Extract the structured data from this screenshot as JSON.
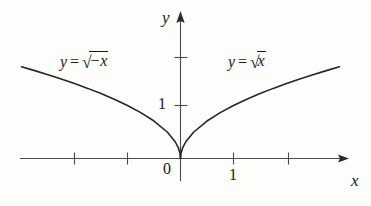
{
  "chart_data": {
    "type": "line",
    "title": "",
    "xlabel": "x",
    "ylabel": "y",
    "xlim": [
      -3.0,
      3.1
    ],
    "ylim": [
      -0.45,
      2.9
    ],
    "grid": false,
    "legend": "inline-annotations",
    "x_ticks": [
      -2,
      -1,
      1,
      2
    ],
    "x_tick_labels": [
      "",
      "",
      "1",
      ""
    ],
    "y_ticks": [
      1,
      2
    ],
    "y_tick_labels": [
      "1",
      ""
    ],
    "origin_label": "0",
    "axis_arrows": [
      "x-positive",
      "y-positive"
    ],
    "series": [
      {
        "name": "y = sqrt(-x)",
        "equation": "y = √(−x)",
        "domain": [
          -3.0,
          0
        ],
        "points": [
          {
            "x": -3.0,
            "y": 1.732
          },
          {
            "x": -2.75,
            "y": 1.658
          },
          {
            "x": -2.5,
            "y": 1.581
          },
          {
            "x": -2.25,
            "y": 1.5
          },
          {
            "x": -2.0,
            "y": 1.414
          },
          {
            "x": -1.75,
            "y": 1.323
          },
          {
            "x": -1.5,
            "y": 1.225
          },
          {
            "x": -1.25,
            "y": 1.118
          },
          {
            "x": -1.0,
            "y": 1.0
          },
          {
            "x": -0.75,
            "y": 0.866
          },
          {
            "x": -0.5,
            "y": 0.707
          },
          {
            "x": -0.25,
            "y": 0.5
          },
          {
            "x": -0.1,
            "y": 0.316
          },
          {
            "x": -0.04,
            "y": 0.2
          },
          {
            "x": -0.01,
            "y": 0.1
          },
          {
            "x": 0,
            "y": 0
          }
        ]
      },
      {
        "name": "y = sqrt(x)",
        "equation": "y = √x",
        "domain": [
          0,
          3.0
        ],
        "points": [
          {
            "x": 0,
            "y": 0
          },
          {
            "x": 0.01,
            "y": 0.1
          },
          {
            "x": 0.04,
            "y": 0.2
          },
          {
            "x": 0.1,
            "y": 0.316
          },
          {
            "x": 0.25,
            "y": 0.5
          },
          {
            "x": 0.5,
            "y": 0.707
          },
          {
            "x": 0.75,
            "y": 0.866
          },
          {
            "x": 1.0,
            "y": 1.0
          },
          {
            "x": 1.25,
            "y": 1.118
          },
          {
            "x": 1.5,
            "y": 1.225
          },
          {
            "x": 1.75,
            "y": 1.323
          },
          {
            "x": 2.0,
            "y": 1.414
          },
          {
            "x": 2.25,
            "y": 1.5
          },
          {
            "x": 2.5,
            "y": 1.581
          },
          {
            "x": 2.75,
            "y": 1.658
          },
          {
            "x": 3.0,
            "y": 1.732
          }
        ]
      }
    ],
    "annotations": [
      {
        "text": "y = √(−x)",
        "x": -1.8,
        "y": 2.3
      },
      {
        "text": "y = √x",
        "x": 1.2,
        "y": 2.3
      }
    ],
    "colors": {
      "curve": "#262626",
      "axis": "#4a4a4a",
      "text": "#1a1a1a",
      "background": "#fdfdfc"
    }
  },
  "labels": {
    "y_axis": "y",
    "x_axis": "x",
    "origin": "0",
    "y_tick_one": "1",
    "x_tick_one": "1"
  },
  "equations": {
    "left": {
      "lhs": "y",
      "equals": "=",
      "radical": "√",
      "radicand": "−x"
    },
    "right": {
      "lhs": "y",
      "equals": "=",
      "radical": "√",
      "radicand": "x"
    }
  }
}
